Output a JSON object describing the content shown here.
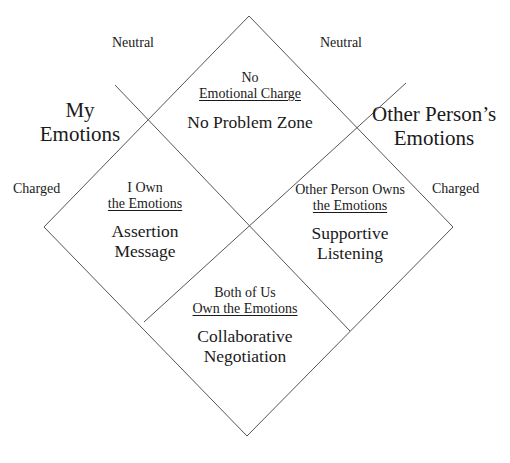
{
  "axes": {
    "left": {
      "title_line1": "My",
      "title_line2": "Emotions",
      "neutral": "Neutral",
      "charged": "Charged"
    },
    "right": {
      "title_line1": "Other Person’s",
      "title_line2": "Emotions",
      "neutral": "Neutral",
      "charged": "Charged"
    }
  },
  "zones": {
    "top": {
      "owner_line1": "No",
      "owner_line2": "Emotional Charge",
      "name_line1": "No Problem Zone"
    },
    "left": {
      "owner_line1": "I Own",
      "owner_line2": "the Emotions",
      "name_line1": "Assertion",
      "name_line2": "Message"
    },
    "right": {
      "owner_line1": "Other Person Owns",
      "owner_line2": "the Emotions",
      "name_line1": "Supportive",
      "name_line2": "Listening"
    },
    "bottom": {
      "owner_line1": "Both of Us",
      "owner_line2": "Own the Emotions",
      "name_line1": "Collaborative",
      "name_line2": "Negotiation"
    }
  },
  "colors": {
    "line": "#555555",
    "text": "#1a1a1a",
    "background": "#ffffff"
  }
}
